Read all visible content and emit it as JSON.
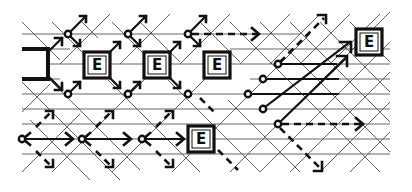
{
  "diagram": {
    "colors": {
      "ink": "#111111",
      "grid": "#555555",
      "background": "#ffffff"
    },
    "grid": {
      "horizontal_rows_y": [
        34,
        49,
        64,
        79,
        94,
        109,
        124,
        139,
        154
      ],
      "diagonal_spacing": 30
    },
    "e_boxes": [
      {
        "id": "e1",
        "label": "E",
        "x": 84,
        "y": 52
      },
      {
        "id": "e2",
        "label": "E",
        "x": 144,
        "y": 52
      },
      {
        "id": "e3",
        "label": "E",
        "x": 204,
        "y": 52
      },
      {
        "id": "e4",
        "label": "E",
        "x": 356,
        "y": 29
      },
      {
        "id": "e5",
        "label": "E",
        "x": 188,
        "y": 126
      }
    ],
    "bracket": {
      "id": "source-bracket",
      "shape": "fork",
      "x": 20,
      "y": 50
    },
    "nodes": [
      {
        "id": "n1",
        "x": 68,
        "y": 34
      },
      {
        "id": "n2",
        "x": 128,
        "y": 34
      },
      {
        "id": "n3",
        "x": 188,
        "y": 34
      },
      {
        "id": "n4",
        "x": 68,
        "y": 94
      },
      {
        "id": "n5",
        "x": 128,
        "y": 94
      },
      {
        "id": "n6",
        "x": 188,
        "y": 94
      },
      {
        "id": "n7",
        "x": 278,
        "y": 64
      },
      {
        "id": "n8",
        "x": 263,
        "y": 79
      },
      {
        "id": "n9",
        "x": 248,
        "y": 94
      },
      {
        "id": "n10",
        "x": 263,
        "y": 109
      },
      {
        "id": "n11",
        "x": 278,
        "y": 124
      },
      {
        "id": "n12",
        "x": 22,
        "y": 139
      },
      {
        "id": "n13",
        "x": 82,
        "y": 139
      },
      {
        "id": "n14",
        "x": 142,
        "y": 139
      }
    ],
    "arrows": [
      {
        "id": "a1",
        "style": "dashed",
        "from": [
          188,
          34
        ],
        "to": [
          262,
          34
        ]
      },
      {
        "id": "a2",
        "style": "dashed",
        "from": [
          278,
          64
        ],
        "to": [
          328,
          14
        ]
      },
      {
        "id": "a3",
        "style": "solid",
        "from": [
          278,
          64
        ],
        "to": [
          352,
          64
        ]
      },
      {
        "id": "a4",
        "style": "solid",
        "from": [
          263,
          79
        ],
        "to": [
          338,
          79
        ]
      },
      {
        "id": "a5",
        "style": "solid",
        "from": [
          248,
          94
        ],
        "to": [
          338,
          94
        ]
      },
      {
        "id": "a6",
        "style": "solid",
        "from": [
          263,
          109
        ],
        "to": [
          350,
          42
        ]
      },
      {
        "id": "a7",
        "style": "solid",
        "from": [
          278,
          124
        ],
        "to": [
          345,
          57
        ]
      },
      {
        "id": "a8",
        "style": "dashed",
        "from": [
          278,
          124
        ],
        "to": [
          366,
          124
        ]
      },
      {
        "id": "a9",
        "style": "dashed",
        "from": [
          278,
          124
        ],
        "to": [
          325,
          172
        ]
      },
      {
        "id": "a10",
        "style": "double",
        "from": [
          22,
          139
        ],
        "to": [
          72,
          139
        ]
      },
      {
        "id": "a11",
        "style": "double",
        "from": [
          82,
          139
        ],
        "to": [
          130,
          139
        ]
      },
      {
        "id": "a12",
        "style": "double",
        "from": [
          142,
          139
        ],
        "to": [
          183,
          139
        ]
      }
    ]
  }
}
